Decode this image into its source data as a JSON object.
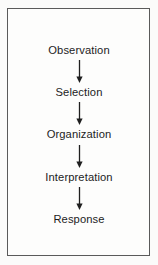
{
  "diagram": {
    "type": "vertical-flowchart",
    "border_color": "#5a5a5a",
    "background_color": "#fdfdfc",
    "text_color": "#1c1c1c",
    "arrow_color": "#1f1f1f",
    "steps": [
      {
        "label": "Observation",
        "y": 44
      },
      {
        "label": "Selection",
        "y": 86
      },
      {
        "label": "Organization",
        "y": 128
      },
      {
        "label": "Interpretation",
        "y": 171
      },
      {
        "label": "Response",
        "y": 213
      }
    ],
    "connectors": [
      {
        "from": "Observation",
        "to": "Selection",
        "icon": "down-arrow-icon",
        "y": 60,
        "length": 22
      },
      {
        "from": "Selection",
        "to": "Organization",
        "icon": "down-arrow-icon",
        "y": 102,
        "length": 22
      },
      {
        "from": "Organization",
        "to": "Interpretation",
        "icon": "down-arrow-icon",
        "y": 145,
        "length": 22
      },
      {
        "from": "Interpretation",
        "to": "Response",
        "icon": "down-arrow-icon",
        "y": 187,
        "length": 22
      }
    ]
  }
}
